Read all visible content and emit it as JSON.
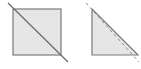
{
  "diagram": {
    "colors": {
      "fill": "#e6e6e6",
      "stroke": "#7a7a7a",
      "dash": "#8a8a8a",
      "background": "#ffffff"
    },
    "shapes": [
      {
        "name": "square",
        "x": 13,
        "y": 9,
        "width": 48,
        "height": 46
      },
      {
        "name": "square-diagonal",
        "x1": 8,
        "y1": 3,
        "x2": 68,
        "y2": 62
      },
      {
        "name": "triangle",
        "points": "92,9 92,55 138,55"
      },
      {
        "name": "triangle-dashed-cut",
        "x1": 86,
        "y1": 3,
        "x2": 139,
        "y2": 62
      }
    ]
  }
}
